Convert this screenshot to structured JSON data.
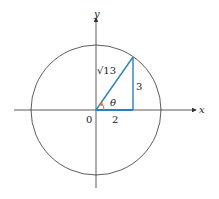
{
  "diagram": {
    "axes": {
      "x_label": "x",
      "y_label": "y",
      "origin_label": "0"
    },
    "triangle": {
      "hypotenuse_label": "√13",
      "adjacent_label": "2",
      "opposite_label": "3",
      "angle_label": "θ"
    },
    "colors": {
      "triangle": "#2a7fc2",
      "angle_arc": "#e07030",
      "axes": "#333333",
      "circle": "#333333"
    }
  }
}
